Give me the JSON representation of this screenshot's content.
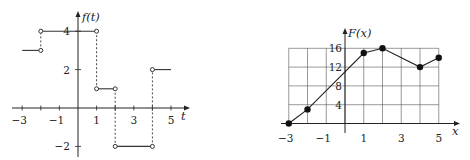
{
  "chart_data": [
    {
      "type": "line",
      "title": "",
      "ylabel": "f(t)",
      "xlabel": "t",
      "xlim": [
        -3.5,
        6
      ],
      "ylim": [
        -2.5,
        4.8
      ],
      "x_ticks": [
        -3,
        -1,
        1,
        3,
        5
      ],
      "x_tick_labels": [
        "−3",
        "−1",
        "1",
        "3",
        "5"
      ],
      "y_ticks": [
        4,
        2,
        -2
      ],
      "y_tick_labels": [
        "4",
        "2",
        "−2"
      ],
      "segments": [
        {
          "x": [
            -3,
            -2
          ],
          "y": [
            3,
            3
          ],
          "open_end": true
        },
        {
          "x": [
            -2,
            1
          ],
          "y": [
            4,
            4
          ],
          "open_start": true,
          "open_end": true
        },
        {
          "x": [
            1,
            2
          ],
          "y": [
            1,
            1
          ],
          "open_start": true,
          "open_end": true
        },
        {
          "x": [
            2,
            4
          ],
          "y": [
            -2,
            -2
          ],
          "open_start": true,
          "open_end": true
        },
        {
          "x": [
            4,
            5
          ],
          "y": [
            2,
            2
          ],
          "open_start": true
        }
      ],
      "dashed_jumps": [
        {
          "x": -2,
          "y": [
            3,
            4
          ]
        },
        {
          "x": 1,
          "y": [
            4,
            1
          ]
        },
        {
          "x": 2,
          "y": [
            1,
            -2
          ]
        },
        {
          "x": 4,
          "y": [
            -2,
            2
          ]
        }
      ],
      "grid": false
    },
    {
      "type": "line",
      "title": "",
      "ylabel": "F(x)",
      "xlabel": "x",
      "xlim": [
        -3.5,
        6.2
      ],
      "ylim": [
        0,
        18
      ],
      "x_ticks": [
        -3,
        -1,
        1,
        3,
        5
      ],
      "x_tick_labels": [
        "−3",
        "−1",
        "1",
        "3",
        "5"
      ],
      "y_ticks": [
        4,
        8,
        12,
        16
      ],
      "y_tick_labels": [
        "4",
        "8",
        "12",
        "16"
      ],
      "grid": true,
      "grid_x": [
        -3,
        5
      ],
      "grid_y": [
        0,
        16
      ],
      "series": [
        {
          "name": "F(x)",
          "x": [
            -3,
            -2,
            1,
            2,
            4,
            5
          ],
          "y": [
            0,
            3,
            15,
            16,
            12,
            14
          ]
        }
      ]
    }
  ]
}
